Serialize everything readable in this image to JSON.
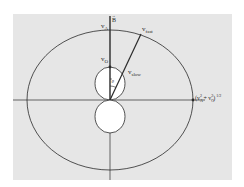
{
  "figure": {
    "type": "velocity-surface-diagram",
    "background_color": "#e6e6e6",
    "line_color": "#2a2a2a",
    "fill_lobes": "#ffffff",
    "labels": {
      "field": {
        "base": "B",
        "vector_mark": "→"
      },
      "va": {
        "base": "v",
        "sub": "A"
      },
      "vfast": {
        "base": "v",
        "sub": "fast"
      },
      "vo": {
        "base": "v",
        "sub": "O"
      },
      "vslow": {
        "base": "v",
        "sub": "slow"
      },
      "theta": "θ",
      "magnitude": {
        "open": "(v",
        "sub1": "A",
        "sup1": "2",
        "plus": " + v",
        "sub2": "O",
        "sup2": "2",
        "close": ")",
        "exp": "1/2"
      }
    }
  }
}
